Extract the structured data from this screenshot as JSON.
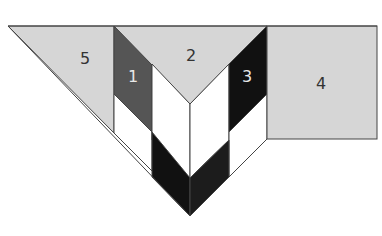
{
  "diagram": {
    "type": "quilt-block-piecing-diagram",
    "colors": {
      "light_gray": "#d6d6d6",
      "dark_gray": "#555555",
      "black": "#111111",
      "white": "#ffffff",
      "outline": "#444444",
      "label_dark": "#333333",
      "label_light": "#e8e8e8"
    },
    "pieces": [
      {
        "id": "1",
        "label": "1",
        "fill": "dark_gray"
      },
      {
        "id": "2",
        "label": "2",
        "fill": "light_gray"
      },
      {
        "id": "3",
        "label": "3",
        "fill": "black"
      },
      {
        "id": "4",
        "label": "4",
        "fill": "light_gray"
      },
      {
        "id": "5",
        "label": "5",
        "fill": "light_gray"
      }
    ],
    "labels": {
      "piece1": "1",
      "piece2": "2",
      "piece3": "3",
      "piece4": "4",
      "piece5": "5"
    }
  }
}
